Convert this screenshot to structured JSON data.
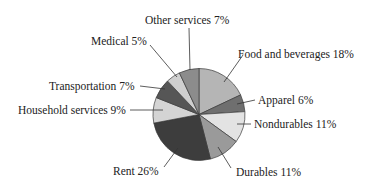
{
  "chart_data": {
    "type": "pie",
    "title": "",
    "start_angle_deg": 0,
    "direction": "clockwise",
    "center": [
      199,
      114.5
    ],
    "radius": 46,
    "slices": [
      {
        "label": "Food and beverages",
        "value": 18,
        "text": "Food and beverages 18%",
        "color": "#b5b5b5",
        "label_pos": [
          238,
          58
        ],
        "anchor": "start",
        "leader": [
          [
            243,
            55
          ],
          [
            224,
            82
          ]
        ]
      },
      {
        "label": "Apparel",
        "value": 6,
        "text": "Apparel 6%",
        "color": "#6f6f6f",
        "label_pos": [
          258,
          104
        ],
        "anchor": "start",
        "leader": [
          [
            255,
            100
          ],
          [
            237,
            104
          ]
        ]
      },
      {
        "label": "Nondurables",
        "value": 11,
        "text": "Nondurables 11%",
        "color": "#e3e3e3",
        "label_pos": [
          254,
          128
        ],
        "anchor": "start",
        "leader": [
          [
            251,
            124
          ],
          [
            237,
            124
          ]
        ]
      },
      {
        "label": "Durables",
        "value": 11,
        "text": "Durables 11%",
        "color": "#9a9a9a",
        "label_pos": [
          236,
          176
        ],
        "anchor": "start",
        "leader": [
          [
            231,
            168
          ],
          [
            218,
            147
          ]
        ]
      },
      {
        "label": "Rent",
        "value": 26,
        "text": "Rent 26%",
        "color": "#3d3d3d",
        "label_pos": [
          113,
          175
        ],
        "anchor": "start",
        "leader": [
          [
            164,
            167
          ],
          [
            178,
            148
          ]
        ]
      },
      {
        "label": "Household services",
        "value": 9,
        "text": "Household services 9%",
        "color": "#d4d4d4",
        "label_pos": [
          18,
          114
        ],
        "anchor": "start",
        "leader": [
          [
            130,
            110
          ],
          [
            163,
            110
          ]
        ]
      },
      {
        "label": "Transportation",
        "value": 7,
        "text": "Transportation 7%",
        "color": "#565656",
        "label_pos": [
          49,
          90
        ],
        "anchor": "start",
        "leader": [
          [
            140,
            86
          ],
          [
            165,
            89
          ]
        ]
      },
      {
        "label": "Medical",
        "value": 5,
        "text": "Medical 5%",
        "color": "#cfcfcf",
        "label_pos": [
          91,
          45
        ],
        "anchor": "start",
        "leader": [
          [
            150,
            45
          ],
          [
            177,
            77
          ]
        ]
      },
      {
        "label": "Other services",
        "value": 7,
        "text": "Other services 7%",
        "color": "#8c8c8c",
        "label_pos": [
          145,
          24
        ],
        "anchor": "start",
        "leader": [
          [
            189,
            28
          ],
          [
            190,
            70
          ]
        ]
      }
    ],
    "legend": "none (direct labels with leader lines)",
    "grid": false
  }
}
